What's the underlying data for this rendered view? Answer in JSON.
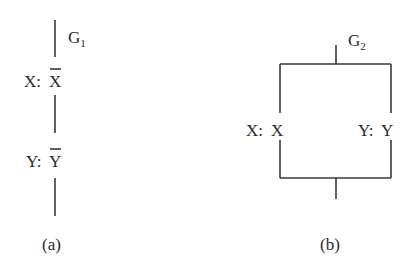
{
  "diagram_a": {
    "caption": "(a)",
    "gate_label": "G",
    "gate_sub": "1",
    "elements": [
      {
        "var": "X:",
        "val": "X",
        "negated": true
      },
      {
        "var": "Y:",
        "val": "Y",
        "negated": true
      }
    ],
    "topology": "series"
  },
  "diagram_b": {
    "caption": "(b)",
    "gate_label": "G",
    "gate_sub": "2",
    "elements": [
      {
        "var": "X:",
        "val": "X",
        "negated": false
      },
      {
        "var": "Y:",
        "val": "Y",
        "negated": false
      }
    ],
    "topology": "parallel"
  }
}
